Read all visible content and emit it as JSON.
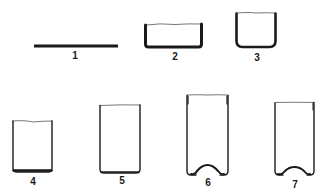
{
  "diagram": {
    "type": "process-stages",
    "colors": {
      "stroke": "#1a1a1a",
      "background": "#ffffff"
    },
    "stages": [
      {
        "id": 1,
        "label": "1",
        "shape": "flat-blank"
      },
      {
        "id": 2,
        "label": "2",
        "shape": "shallow-cup"
      },
      {
        "id": 3,
        "label": "3",
        "shape": "cup"
      },
      {
        "id": 4,
        "label": "4",
        "shape": "deeper-cup"
      },
      {
        "id": 5,
        "label": "5",
        "shape": "tall-cup"
      },
      {
        "id": 6,
        "label": "6",
        "shape": "can-domed-bottom"
      },
      {
        "id": 7,
        "label": "7",
        "shape": "can-domed-bottom-trimmed"
      }
    ]
  }
}
